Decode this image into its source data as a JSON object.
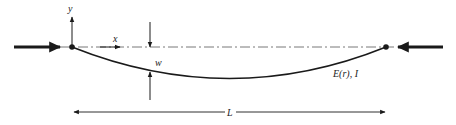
{
  "diagram": {
    "type": "column-buckling",
    "labels": {
      "y_axis": "y",
      "x_axis": "x",
      "deflection": "w",
      "material": "E(r), I",
      "length": "L"
    },
    "colors": {
      "stroke": "#1a1a1a",
      "centerline": "#555555",
      "background": "#ffffff"
    }
  }
}
